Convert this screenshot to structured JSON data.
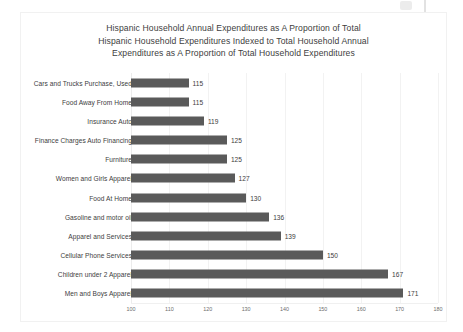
{
  "chart_data": {
    "type": "bar",
    "orientation": "horizontal",
    "title_lines": [
      "Hispanic Household Annual Expenditures as A Proportion of Total",
      "Hispanic Household Expenditures Indexed to Total Household Annual",
      "Expenditures as A Proportion of Total Household Expenditures"
    ],
    "title": "Hispanic Household Annual Expenditures as A Proportion of Total Hispanic Household Expenditures Indexed to Total Household Annual Expenditures as A Proportion of Total Household Expenditures",
    "xlabel": "",
    "ylabel": "",
    "xlim": [
      100,
      180
    ],
    "xticks": [
      100,
      110,
      120,
      130,
      140,
      150,
      160,
      170,
      180
    ],
    "grid": true,
    "legend": false,
    "bar_color": "#5a5a5a",
    "categories": [
      "Cars and Trucks Purchase, Used",
      "Food Away From Home",
      "Insurance Auto",
      "Finance Charges Auto Financing",
      "Furniture",
      "Women and Girls Apparel",
      "Food At Home",
      "Gasoline and motor oil",
      "Apparel and Services",
      "Cellular Phone Services",
      "Children under 2 Apparel",
      "Men and Boys Apparel"
    ],
    "values": [
      115,
      115,
      119,
      125,
      125,
      127,
      130,
      136,
      139,
      150,
      167,
      171
    ],
    "data_labels": [
      "115",
      "115",
      "119",
      "125",
      "125",
      "127",
      "130",
      "136",
      "139",
      "150",
      "167",
      "171"
    ],
    "tick_labels": [
      "100",
      "110",
      "120",
      "130",
      "140",
      "150",
      "160",
      "170",
      "180"
    ]
  }
}
